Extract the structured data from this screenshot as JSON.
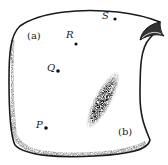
{
  "figure": {
    "region_labels": {
      "a": "(a)",
      "b": "(b)"
    },
    "points": [
      {
        "id": "P",
        "label": "P",
        "x": 46,
        "y": 128,
        "lx": 36,
        "ly": 120
      },
      {
        "id": "Q",
        "label": "Q",
        "x": 58,
        "y": 71,
        "lx": 47,
        "ly": 63
      },
      {
        "id": "R",
        "label": "R",
        "x": 76,
        "y": 44,
        "lx": 66,
        "ly": 32
      },
      {
        "id": "S",
        "label": "S",
        "x": 115,
        "y": 19,
        "lx": 102,
        "ly": 12
      }
    ],
    "colors": {
      "outline": "#1a1a1a",
      "shading": "#111111",
      "label": "#222222"
    }
  }
}
